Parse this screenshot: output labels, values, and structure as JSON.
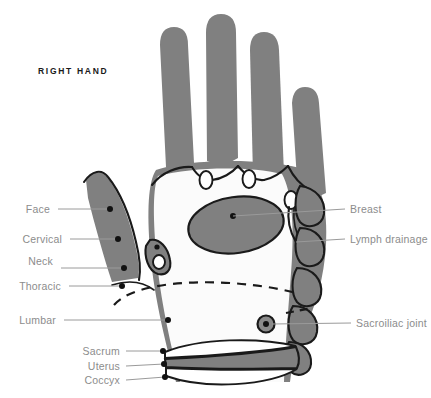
{
  "title": "RIGHT HAND",
  "colors": {
    "zone_fill": "#808080",
    "outline": "#1a1a1a",
    "label_text": "#8c8c8c",
    "leader_line": "#9a9a9a",
    "background": "#ffffff"
  },
  "labels_left": [
    {
      "name": "face",
      "text": "Face",
      "x": 50,
      "y": 209
    },
    {
      "name": "cervical",
      "text": "Cervical",
      "x": 62,
      "y": 239
    },
    {
      "name": "neck",
      "text": "Neck",
      "x": 53,
      "y": 261
    },
    {
      "name": "thoracic",
      "text": "Thoracic",
      "x": 61,
      "y": 286
    },
    {
      "name": "lumbar",
      "text": "Lumbar",
      "x": 56,
      "y": 320
    }
  ],
  "labels_right": [
    {
      "name": "breast",
      "text": "Breast",
      "x": 350,
      "y": 209
    },
    {
      "name": "lymph-drainage",
      "text": "Lymph drainage",
      "x": 350,
      "y": 239
    },
    {
      "name": "sacroiliac-joint",
      "text": "Sacroiliac joint",
      "x": 356,
      "y": 323
    }
  ],
  "labels_bottom": [
    {
      "name": "sacrum",
      "text": "Sacrum",
      "x": 120,
      "y": 351
    },
    {
      "name": "uterus",
      "text": "Uterus",
      "x": 120,
      "y": 366
    },
    {
      "name": "coccyx",
      "text": "Coccyx",
      "x": 120,
      "y": 380
    }
  ],
  "reflex_zones": [
    {
      "name": "face",
      "region": "thumb-upper"
    },
    {
      "name": "cervical",
      "region": "thumb-lower"
    },
    {
      "name": "neck",
      "region": "thumb-base"
    },
    {
      "name": "thoracic",
      "region": "diaphragm-dashed-line"
    },
    {
      "name": "lumbar",
      "region": "lower-palm"
    },
    {
      "name": "breast",
      "region": "palm-ellipse"
    },
    {
      "name": "lymph-drainage",
      "region": "palm-hook"
    },
    {
      "name": "sacroiliac-joint",
      "region": "wrist-disc"
    },
    {
      "name": "sacrum",
      "region": "wrist-upper-band"
    },
    {
      "name": "uterus",
      "region": "wrist-gray-band"
    },
    {
      "name": "coccyx",
      "region": "wrist-lower-arc"
    }
  ]
}
